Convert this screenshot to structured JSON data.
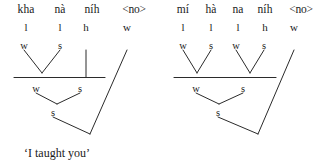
{
  "diagrams": [
    {
      "id": "left",
      "gloss": "‘I taught you’",
      "words": [
        "kha",
        "nà",
        "níh",
        "<no>"
      ],
      "tier2": [
        "l",
        "l",
        "h",
        "w"
      ],
      "tier3": [
        "w",
        "s"
      ],
      "tier4": [
        "w",
        "s"
      ],
      "tier5": [
        "s"
      ]
    },
    {
      "id": "right",
      "gloss": "‘You taught him’",
      "words": [
        "mí",
        "hà",
        "na",
        "níh",
        "<no>"
      ],
      "tier2": [
        "l",
        "l",
        "l",
        "h",
        "w"
      ],
      "tier3": [
        "w",
        "s",
        "w",
        "s"
      ],
      "tier4": [
        "w",
        "s"
      ],
      "tier5": [
        "s"
      ]
    }
  ],
  "style": {
    "line_color": "#2b2b2b",
    "text_color": "#1a1a1a",
    "background": "#ffffff"
  }
}
